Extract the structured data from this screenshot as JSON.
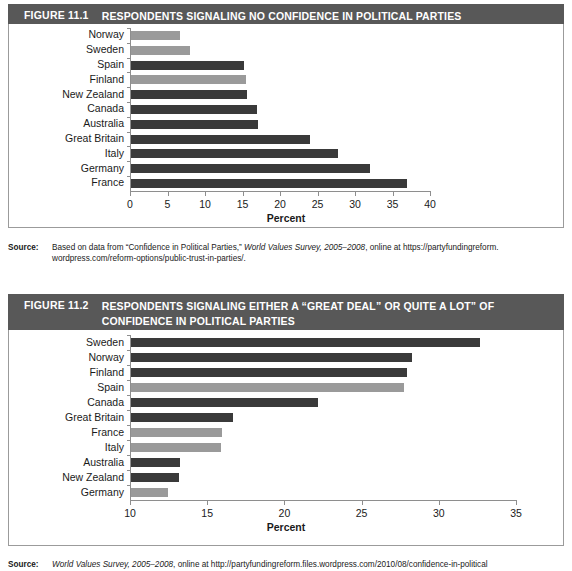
{
  "figures": [
    {
      "number": "FIGURE 11.1",
      "title": "RESPONDENTS SIGNALING NO CONFIDENCE IN POLITICAL PARTIES",
      "source_label": "Source:",
      "source_text_1": "Based on data from “Confidence in Political Parties,” ",
      "source_italic": "World Values Survey, 2005–2008",
      "source_text_2": ", online at https://partyfundingreform.",
      "source_text_3": "wordpress.com/reform-options/public-trust-in-parties/."
    },
    {
      "number": "FIGURE 11.2",
      "title": "RESPONDENTS SIGNALING EITHER A “GREAT DEAL” OR QUITE A LOT” OF CONFIDENCE IN POLITICAL PARTIES",
      "source_label": "Source:",
      "source_italic": "World Values Survey, 2005–2008",
      "source_text_2": ", online at http://partyfundingreform.files.wordpress.com/2010/08/confidence-in-political"
    }
  ],
  "colors": {
    "header_band": "#585858",
    "bar_dark": "#3a3a3a",
    "bar_light": "#9a9a9a",
    "axis": "#8e8e8e",
    "plate_border": "#9b9b9b",
    "text": "#1a1a1a"
  },
  "chart_data": [
    {
      "type": "bar",
      "orientation": "horizontal",
      "title": "RESPONDENTS SIGNALING NO CONFIDENCE IN POLITICAL PARTIES",
      "xlabel": "Percent",
      "ylabel": "",
      "xlim": [
        0,
        40
      ],
      "xticks": [
        0,
        5,
        10,
        15,
        20,
        25,
        30,
        35,
        40
      ],
      "grid": false,
      "legend": "none",
      "categories": [
        "Norway",
        "Sweden",
        "Spain",
        "Finland",
        "New Zealand",
        "Canada",
        "Australia",
        "Great Britain",
        "Italy",
        "Germany",
        "France"
      ],
      "values": [
        6.5,
        7.8,
        15.0,
        15.3,
        15.5,
        16.8,
        16.9,
        23.8,
        27.6,
        31.8,
        36.8
      ],
      "bar_shades": [
        "light",
        "light",
        "dark",
        "light",
        "dark",
        "dark",
        "dark",
        "dark",
        "dark",
        "dark",
        "dark"
      ]
    },
    {
      "type": "bar",
      "orientation": "horizontal",
      "title": "RESPONDENTS SIGNALING EITHER A “GREAT DEAL” OR QUITE A LOT” OF CONFIDENCE IN POLITICAL PARTIES",
      "xlabel": "Percent",
      "ylabel": "",
      "xlim": [
        10,
        35
      ],
      "xticks": [
        10,
        15,
        20,
        25,
        30,
        35
      ],
      "grid": false,
      "legend": "none",
      "categories": [
        "Sweden",
        "Norway",
        "Finland",
        "Spain",
        "Canada",
        "Great Britain",
        "France",
        "Italy",
        "Australia",
        "New Zealand",
        "Germany"
      ],
      "values": [
        32.6,
        28.2,
        27.9,
        27.7,
        22.1,
        16.6,
        15.9,
        15.8,
        13.2,
        13.1,
        12.4
      ],
      "bar_shades": [
        "dark",
        "dark",
        "dark",
        "light",
        "dark",
        "dark",
        "light",
        "light",
        "dark",
        "dark",
        "light"
      ]
    }
  ]
}
